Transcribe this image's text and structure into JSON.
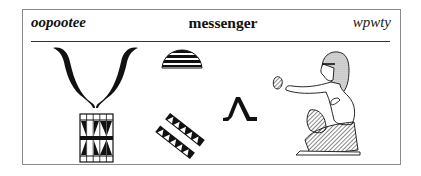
{
  "header": {
    "transliteration_english": "oopootee",
    "word": "messenger",
    "transliteration_egyptian": "wpwty"
  },
  "glyphs": [
    {
      "name": "horns-icon",
      "description": "pair of curved horns"
    },
    {
      "name": "decorated-box-icon",
      "description": "patterned rectangular block"
    },
    {
      "name": "bread-loaf-icon",
      "description": "striped semicircular loaf"
    },
    {
      "name": "cord-bands-icon",
      "description": "two diagonal patterned bands"
    },
    {
      "name": "walking-legs-icon",
      "description": "walking legs determinative"
    },
    {
      "name": "seated-man-icon",
      "description": "seated man with raised hand"
    }
  ]
}
